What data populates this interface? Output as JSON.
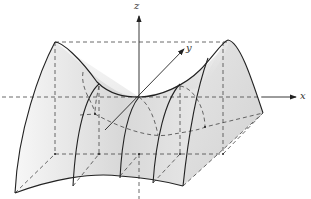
{
  "figure": {
    "axes": {
      "x_label": "x",
      "y_label": "y",
      "z_label": "z"
    },
    "colors": {
      "line": "#222222",
      "dashed": "#444444",
      "surface_light": "#f4f4f4",
      "surface_shade": "#cfcfcf",
      "background": "#ffffff"
    }
  }
}
